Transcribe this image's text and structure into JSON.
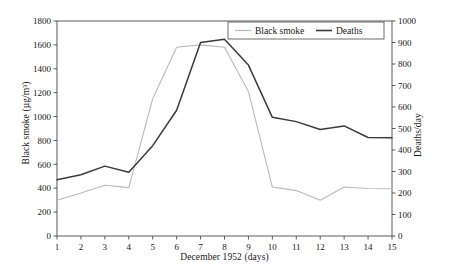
{
  "chart_data": {
    "type": "line",
    "title": "",
    "xlabel": "December 1952 (days)",
    "ylabel": "Black smoke (µg/m³)",
    "y2label": "Deaths/day",
    "x": [
      1,
      2,
      3,
      4,
      5,
      6,
      7,
      8,
      9,
      10,
      11,
      12,
      13,
      14,
      15
    ],
    "categories": [
      "1",
      "2",
      "3",
      "4",
      "5",
      "6",
      "7",
      "8",
      "9",
      "10",
      "11",
      "12",
      "13",
      "14",
      "15"
    ],
    "xlim": [
      1,
      15
    ],
    "ylim": [
      0,
      1800
    ],
    "y2lim": [
      0,
      1000
    ],
    "yticks": [
      0,
      200,
      400,
      600,
      800,
      1000,
      1200,
      1400,
      1600,
      1800
    ],
    "ytick_labels": [
      "0",
      "200",
      "400",
      "600",
      "800",
      "1000",
      "1200",
      "1400",
      "1600",
      "1800"
    ],
    "y2ticks": [
      0,
      100,
      200,
      300,
      400,
      500,
      600,
      700,
      800,
      900,
      1000
    ],
    "y2tick_labels": [
      "0",
      "100",
      "200",
      "300",
      "400",
      "500",
      "600",
      "700",
      "800",
      "900",
      "1000"
    ],
    "grid": false,
    "legend_position": "top-right",
    "series": [
      {
        "name": "Black smoke",
        "axis": "left",
        "unit": "µg/m³",
        "color": "#b9b9b9",
        "values": [
          300,
          360,
          425,
          405,
          1150,
          1580,
          1600,
          1580,
          1210,
          410,
          380,
          300,
          410,
          398,
          395
        ]
      },
      {
        "name": "Deaths",
        "axis": "right",
        "unit": "deaths/day",
        "color": "#3a3a3a",
        "values": [
          262,
          285,
          325,
          297,
          420,
          585,
          900,
          915,
          795,
          552,
          532,
          495,
          512,
          458,
          457
        ]
      }
    ]
  },
  "legend": {
    "entries": [
      {
        "label": "Black smoke",
        "color": "#b9b9b9"
      },
      {
        "label": "Deaths",
        "color": "#3a3a3a"
      }
    ]
  },
  "axes": {
    "x_title": "December 1952 (days)",
    "y_left_title": "Black smoke (µg/m³)",
    "y_right_title": "Deaths/day"
  },
  "colors": {
    "black_smoke": "#b9b9b9",
    "deaths": "#3a3a3a",
    "frame": "#4a4a4a",
    "background": "#ffffff"
  }
}
